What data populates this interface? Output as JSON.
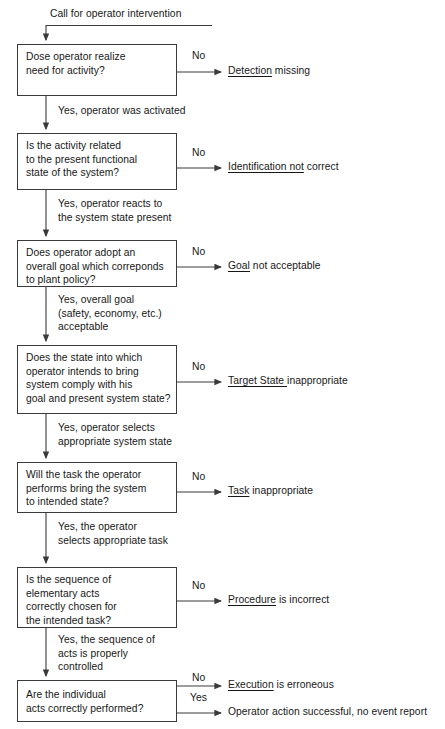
{
  "diagram": {
    "title_label": "Call for operator intervention",
    "no_label": "No",
    "yes_label": "Yes",
    "colors": {
      "line": "#3a3a3a",
      "text": "#171717",
      "background": "#ffffff"
    },
    "steps": [
      {
        "id": "detection",
        "question_lines": [
          "Dose operator realize",
          "need for activity?"
        ],
        "no_label": "No",
        "no_outcome_underlined": "Detection",
        "no_outcome_plain": " missing",
        "yes_lines": [
          "Yes, operator was activated"
        ]
      },
      {
        "id": "identification",
        "question_lines": [
          "Is the activity related",
          "to the present functional",
          "state of the system?"
        ],
        "no_label": "No",
        "no_outcome_underlined": "Identification not",
        "no_outcome_plain": " correct",
        "yes_lines": [
          "Yes, operator reacts to",
          "the system state present"
        ]
      },
      {
        "id": "goal",
        "question_lines": [
          "Does operator adopt an",
          "overall goal which correponds",
          "to plant policy?"
        ],
        "no_label": "No",
        "no_outcome_underlined": "Goal",
        "no_outcome_plain": " not acceptable",
        "yes_lines": [
          "Yes, overall goal",
          "(safety, economy, etc.)",
          "acceptable"
        ]
      },
      {
        "id": "target-state",
        "question_lines": [
          "Does the state into which",
          "operator intends to bring",
          "system comply with his",
          "goal and present system state?"
        ],
        "no_label": "No",
        "no_outcome_underlined": "Target State ",
        "no_outcome_plain": " inappropriate",
        "yes_lines": [
          "Yes, operator selects",
          "appropriate system state"
        ]
      },
      {
        "id": "task",
        "question_lines": [
          "Will the task the operator",
          "performs bring the system",
          "to intended state?"
        ],
        "no_label": "No",
        "no_outcome_underlined": "Task",
        "no_outcome_plain": " inappropriate",
        "yes_lines": [
          "Yes, the operator",
          "selects appropriate task"
        ]
      },
      {
        "id": "procedure",
        "question_lines": [
          "Is the sequence of",
          "elementary acts",
          "correctly chosen for",
          "the intended task?"
        ],
        "no_label": "No",
        "no_outcome_underlined": "Procedure",
        "no_outcome_plain": " is incorrect",
        "yes_lines": [
          "Yes, the sequence of",
          "acts is properly",
          "controlled"
        ]
      },
      {
        "id": "execution",
        "question_lines": [
          "Are the individual",
          "acts correctly performed?"
        ],
        "no_label": "No",
        "no_outcome_underlined": "Execution",
        "no_outcome_plain": " is erroneous",
        "yes_label": "Yes",
        "yes_outcome_underlined": "",
        "yes_outcome_plain": "Operator action successful, no event report"
      }
    ]
  }
}
